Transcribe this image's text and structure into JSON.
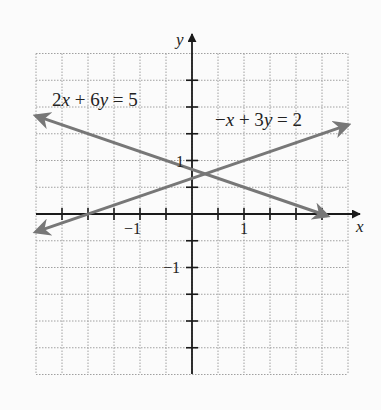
{
  "chart_data": {
    "type": "line",
    "title": "",
    "xlabel": "x",
    "ylabel": "y",
    "xlim": [
      -3,
      3
    ],
    "ylim": [
      -3,
      3
    ],
    "grid": true,
    "grid_step": 0.5,
    "tick_step": 0.5,
    "x_tick_labels": [
      {
        "value": -1,
        "text": "−1"
      },
      {
        "value": 1,
        "text": "1"
      }
    ],
    "y_tick_labels": [
      {
        "value": 1,
        "text": "1"
      },
      {
        "value": -1,
        "text": "−1"
      }
    ],
    "series": [
      {
        "name": "2x + 6y = 5",
        "equation": "2x + 6y = 5",
        "slope": -0.3333,
        "intercept": 0.8333,
        "x": [
          -3.0,
          2.6
        ],
        "y": [
          1.8333,
          -0.0333
        ],
        "color": "#777777",
        "arrows": "both"
      },
      {
        "name": "-x + 3y = 2",
        "equation": "−x + 3y = 2",
        "slope": 0.3333,
        "intercept": 0.6667,
        "x": [
          -3.0,
          3.0
        ],
        "y": [
          -0.3333,
          1.6667
        ],
        "color": "#777777",
        "arrows": "both"
      }
    ],
    "intersection": {
      "x": 0.25,
      "y": 0.75
    },
    "annotations": [
      {
        "text": "2x + 6y = 5",
        "x": -2.0,
        "y": 2.2
      },
      {
        "text": "−x + 3y = 2",
        "x": 1.3,
        "y": 2.0
      }
    ]
  },
  "labels": {
    "x_axis": "x",
    "y_axis": "y",
    "tick_x_neg1": "−1",
    "tick_x_pos1": "1",
    "tick_y_pos1": "1",
    "tick_y_neg1": "−1",
    "eq1_lhs_a": "2",
    "eq1_lhs_b": "x",
    "eq1_rest": " + 6",
    "eq1_y": "y",
    "eq1_rhs": " = 5",
    "eq2_minus": "−",
    "eq2_x": "x",
    "eq2_rest": " + 3",
    "eq2_y": "y",
    "eq2_rhs": " = 2"
  },
  "colors": {
    "axis": "#1a1a1a",
    "grid": "#9a9a9a",
    "line": "#777777",
    "background": "#fbfbfb"
  }
}
